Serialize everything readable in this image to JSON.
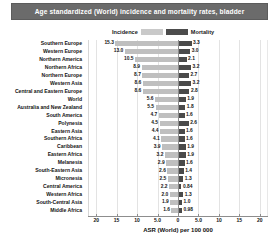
{
  "title": "Age standardized (World) incidence and mortality rates, bladder",
  "legend": {
    "incidence_label": "Incidence",
    "mortality_label": "Mortality",
    "incidence_color": "#bfbfbf",
    "mortality_color": "#4a4a4a"
  },
  "axis": {
    "title": "ASR (World) per 100 000",
    "ticks": [
      "20",
      "15",
      "10",
      "5.0",
      "0",
      "5.0",
      "10",
      "15",
      "20"
    ]
  },
  "chart_data": {
    "type": "bar",
    "orientation": "horizontal-diverging",
    "title": "Age standardized (World) incidence and mortality rates, bladder",
    "xlabel": "ASR (World) per 100 000",
    "ylabel": "",
    "xlim": [
      -22,
      22
    ],
    "xticks": [
      -20,
      -15,
      -10,
      -5,
      0,
      5,
      10,
      15,
      20
    ],
    "xticklabels": [
      "20",
      "15",
      "10",
      "5.0",
      "0",
      "5.0",
      "10",
      "15",
      "20"
    ],
    "grid": true,
    "legend_position": "top-center",
    "categories": [
      "Southern Europe",
      "Western Europe",
      "Northern America",
      "Northern Africa",
      "Northern Europe",
      "Western Asia",
      "Central and Eastern Europe",
      "World",
      "Australia and New Zealand",
      "South America",
      "Polynesia",
      "Eastern Asia",
      "Southern Africa",
      "Caribbean",
      "Eastern Africa",
      "Melanesia",
      "South-Eastern Asia",
      "Micronesia",
      "Central America",
      "Western Africa",
      "South-Central Asia",
      "Middle Africa"
    ],
    "series": [
      {
        "name": "Incidence",
        "side": "left",
        "color": "#bfbfbf",
        "values": [
          15.3,
          13.0,
          10.5,
          8.9,
          8.7,
          8.6,
          8.6,
          5.6,
          5.5,
          4.7,
          4.5,
          4.4,
          4.1,
          3.9,
          3.2,
          2.9,
          2.6,
          2.5,
          2.2,
          2.0,
          1.9,
          1.6
        ]
      },
      {
        "name": "Mortality",
        "side": "right",
        "color": "#4a4a4a",
        "values": [
          3.3,
          3.0,
          2.1,
          3.2,
          2.7,
          3.2,
          2.8,
          1.9,
          1.8,
          1.6,
          2.6,
          1.6,
          1.6,
          1.9,
          1.9,
          1.6,
          1.4,
          1.3,
          0.84,
          1.3,
          1.0,
          0.98
        ]
      }
    ],
    "value_labels": {
      "incidence": [
        "15.3",
        "13.0",
        "10.5",
        "8.9",
        "8.7",
        "8.6",
        "8.6",
        "5.6",
        "5.5",
        "4.7",
        "4.5",
        "4.4",
        "4.1",
        "3.9",
        "3.2",
        "2.9",
        "2.6",
        "2.5",
        "2.2",
        "2.0",
        "1.9",
        "1.6"
      ],
      "mortality": [
        "3.3",
        "3.0",
        "2.1",
        "3.2",
        "2.7",
        "3.2",
        "2.8",
        "1.9",
        "1.8",
        "1.6",
        "2.6",
        "1.6",
        "1.6",
        "1.9",
        "1.9",
        "1.6",
        "1.4",
        "1.3",
        "0.84",
        "1.3",
        "1.0",
        "0.98"
      ]
    }
  }
}
